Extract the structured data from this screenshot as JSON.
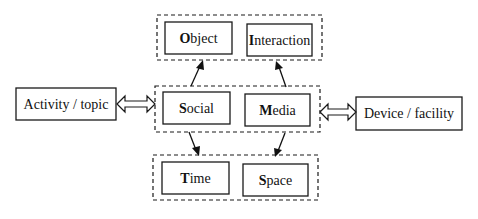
{
  "diagram": {
    "type": "concept-framework",
    "groups": {
      "top": {
        "nodes": [
          {
            "initial": "O",
            "rest": "bject",
            "label": "Object"
          },
          {
            "initial": "I",
            "rest": "nteraction",
            "label": "Interaction"
          }
        ]
      },
      "middle": {
        "nodes": [
          {
            "initial": "S",
            "rest": "ocial",
            "label": "Social"
          },
          {
            "initial": "M",
            "rest": "edia",
            "label": "Media"
          }
        ]
      },
      "bottom": {
        "nodes": [
          {
            "initial": "T",
            "rest": "ime",
            "label": "Time"
          },
          {
            "initial": "S",
            "rest": "pace",
            "label": "Space"
          }
        ]
      }
    },
    "external": {
      "left": {
        "label": "Activity / topic"
      },
      "right": {
        "label": "Device / facility"
      }
    },
    "edges": [
      {
        "from": "middle",
        "to": "top",
        "style": "arrow",
        "count": 2
      },
      {
        "from": "middle",
        "to": "bottom",
        "style": "arrow",
        "count": 2
      },
      {
        "from": "external.left",
        "to": "middle",
        "style": "double-hollow-arrow"
      },
      {
        "from": "middle",
        "to": "external.right",
        "style": "double-hollow-arrow"
      }
    ]
  }
}
